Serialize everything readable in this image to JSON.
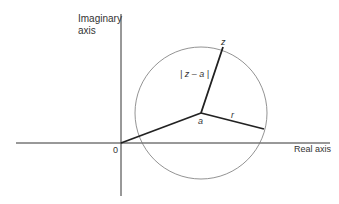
{
  "diagram": {
    "axes": {
      "imaginary_label_line1": "Imaginary",
      "imaginary_label_line2": "axis",
      "real_label": "Real axis",
      "origin_label": "0"
    },
    "points": {
      "center_label": "a",
      "point_label": "z",
      "radius_label": "r",
      "distance_label": "| z – a |"
    },
    "colors": {
      "axis": "#333333",
      "circle": "#777777",
      "segments": "#222222",
      "text": "#333333"
    }
  }
}
